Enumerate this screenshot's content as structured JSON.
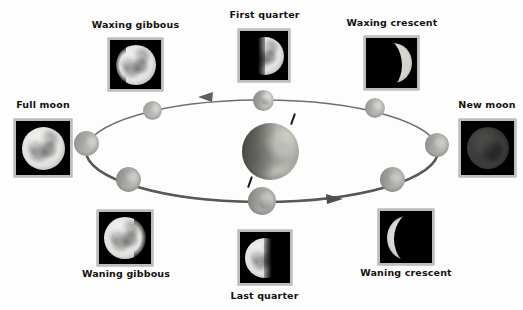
{
  "diagram": {
    "background_color": "#fdfdfd",
    "label_color": "#14110f",
    "orbit_color": "#6f6f6f",
    "center_body": "earth"
  },
  "phases": [
    {
      "id": "waxing-gibbous",
      "label": "Waxing gibbous",
      "label_position": "above",
      "photo": {
        "x": 108,
        "y": 38,
        "w": 55,
        "h": 53
      },
      "label_box": {
        "x": 83,
        "y": 19,
        "w": 105
      },
      "illumination": "gibbous-right",
      "lit_fraction": 0.78
    },
    {
      "id": "first-quarter",
      "label": "First quarter",
      "label_position": "above",
      "photo": {
        "x": 238,
        "y": 29,
        "w": 52,
        "h": 53
      },
      "label_box": {
        "x": 212,
        "y": 9,
        "w": 105
      },
      "illumination": "half-right",
      "lit_fraction": 0.5
    },
    {
      "id": "waxing-crescent",
      "label": "Waxing crescent",
      "label_position": "above",
      "photo": {
        "x": 364,
        "y": 36,
        "w": 55,
        "h": 54
      },
      "label_box": {
        "x": 338,
        "y": 17,
        "w": 108
      },
      "illumination": "crescent-right",
      "lit_fraction": 0.22
    },
    {
      "id": "new-moon",
      "label": "New moon",
      "label_position": "above",
      "photo": {
        "x": 459,
        "y": 119,
        "w": 57,
        "h": 58
      },
      "label_box": {
        "x": 452,
        "y": 99,
        "w": 70
      },
      "illumination": "new",
      "lit_fraction": 0.02
    },
    {
      "id": "waning-crescent",
      "label": "Waning crescent",
      "label_position": "below",
      "photo": {
        "x": 378,
        "y": 209,
        "w": 56,
        "h": 56
      },
      "label_box": {
        "x": 352,
        "y": 267,
        "w": 108
      },
      "illumination": "crescent-left",
      "lit_fraction": 0.2
    },
    {
      "id": "last-quarter",
      "label": "Last quarter",
      "label_position": "below",
      "photo": {
        "x": 238,
        "y": 230,
        "w": 54,
        "h": 55
      },
      "label_box": {
        "x": 212,
        "y": 290,
        "w": 105
      },
      "illumination": "half-left",
      "lit_fraction": 0.5
    },
    {
      "id": "waning-gibbous",
      "label": "Waning gibbous",
      "label_position": "below",
      "photo": {
        "x": 97,
        "y": 210,
        "w": 56,
        "h": 56
      },
      "label_box": {
        "x": 72,
        "y": 268,
        "w": 108
      },
      "illumination": "gibbous-left",
      "lit_fraction": 0.76
    },
    {
      "id": "full-moon",
      "label": "Full moon",
      "label_position": "above",
      "photo": {
        "x": 14,
        "y": 119,
        "w": 58,
        "h": 58
      },
      "label_box": {
        "x": 7,
        "y": 99,
        "w": 72
      },
      "illumination": "full",
      "lit_fraction": 1.0
    }
  ],
  "orbit": {
    "center_x": 262,
    "center_y": 151,
    "radius_x": 176,
    "radius_y": 51,
    "stroke": "#6f6f6f",
    "direction": "counterclockwise-viewed",
    "arrows": [
      {
        "id": "arrow-top-left",
        "x": 205,
        "y": 97,
        "points": "left"
      },
      {
        "id": "arrow-bottom-right",
        "x": 330,
        "y": 199,
        "points": "right"
      }
    ],
    "moon_positions": [
      {
        "id": "orbit-moon-top",
        "x": 263,
        "y": 100,
        "size": 21
      },
      {
        "id": "orbit-moon-upper-left",
        "x": 152,
        "y": 110,
        "size": 19
      },
      {
        "id": "orbit-moon-left",
        "x": 86,
        "y": 143,
        "size": 25
      },
      {
        "id": "orbit-moon-lower-left",
        "x": 128,
        "y": 179,
        "size": 25
      },
      {
        "id": "orbit-moon-bottom",
        "x": 262,
        "y": 201,
        "size": 28
      },
      {
        "id": "orbit-moon-lower-right",
        "x": 392,
        "y": 179,
        "size": 25
      },
      {
        "id": "orbit-moon-right",
        "x": 437,
        "y": 145,
        "size": 24
      },
      {
        "id": "orbit-moon-upper-right",
        "x": 375,
        "y": 108,
        "size": 20
      }
    ]
  },
  "earth": {
    "name": "Earth",
    "x": 270,
    "y": 151,
    "diameter": 57,
    "axis_tilt_degrees": 23.5
  }
}
